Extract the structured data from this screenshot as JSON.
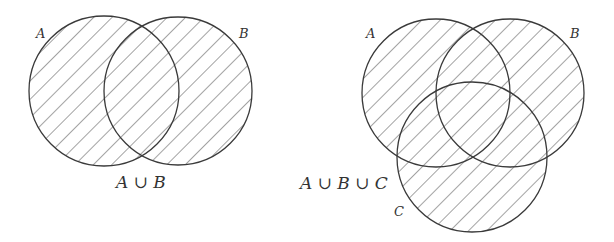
{
  "diagrams": [
    {
      "id": "union-two",
      "expression": "A ∪ B",
      "sets": [
        {
          "name": "A",
          "cx": 104,
          "cy": 91,
          "r": 75,
          "label_x": 36,
          "label_y": 38
        },
        {
          "name": "B",
          "cx": 178,
          "cy": 91,
          "r": 74,
          "label_x": 239,
          "label_y": 38
        }
      ],
      "expression_pos": {
        "x": 116,
        "y": 188
      },
      "shading": "hatched"
    },
    {
      "id": "union-three",
      "expression": "A ∪ B ∪ C",
      "sets": [
        {
          "name": "A",
          "cx": 436,
          "cy": 93,
          "r": 74,
          "label_x": 366,
          "label_y": 38
        },
        {
          "name": "B",
          "cx": 510,
          "cy": 93,
          "r": 74,
          "label_x": 570,
          "label_y": 38
        },
        {
          "name": "C",
          "cx": 472,
          "cy": 157,
          "r": 75,
          "label_x": 394,
          "label_y": 216
        }
      ],
      "expression_pos": {
        "x": 300,
        "y": 189
      },
      "shading": "hatched"
    }
  ],
  "colors": {
    "stroke": "#3a3a3a",
    "hatch": "#555555",
    "background": "#ffffff"
  }
}
